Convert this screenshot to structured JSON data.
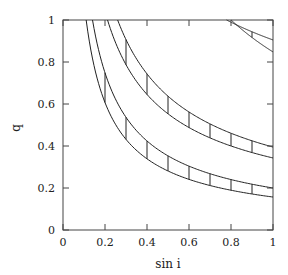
{
  "chart_data": {
    "type": "line",
    "title": "",
    "xlabel": "sin i",
    "ylabel": "q",
    "xlim": [
      0,
      1
    ],
    "ylim": [
      0,
      1
    ],
    "grid": false,
    "legend": null,
    "x_ticks": [
      "0",
      "0.2",
      "0.4",
      "0.6",
      "0.8",
      "1"
    ],
    "y_ticks": [
      "0",
      "0.2",
      "0.4",
      "0.6",
      "0.8",
      "1"
    ],
    "bands": [
      {
        "name": "band-low",
        "upper": {
          "q_at_sini_1": 0.2,
          "sini_at_q_1": 0.14,
          "exponent": 0.82
        },
        "lower": {
          "q_at_sini_1": 0.157,
          "sini_at_q_1": 0.11,
          "exponent": 0.84
        },
        "hatch_x": [
          0.2,
          0.3,
          0.4,
          0.5,
          0.6,
          0.7,
          0.8,
          0.9
        ]
      },
      {
        "name": "band-mid",
        "upper": {
          "q_at_sini_1": 0.395,
          "sini_at_q_1": 0.26,
          "exponent": 0.69
        },
        "lower": {
          "q_at_sini_1": 0.343,
          "sini_at_q_1": 0.21,
          "exponent": 0.69
        },
        "hatch_x": [
          0.3,
          0.4,
          0.5,
          0.6,
          0.7,
          0.8,
          0.9
        ]
      },
      {
        "name": "band-high",
        "upper": {
          "q_at_sini_1": 0.905,
          "sini_at_q_1": 0.78,
          "exponent": 0.4
        },
        "lower": {
          "q_at_sini_1": 0.848,
          "sini_at_q_1": 0.8,
          "exponent": 0.74
        },
        "hatch_x": [
          0.8,
          0.9
        ]
      }
    ]
  },
  "axes": {
    "x_label": "sin i",
    "y_label": "q"
  }
}
